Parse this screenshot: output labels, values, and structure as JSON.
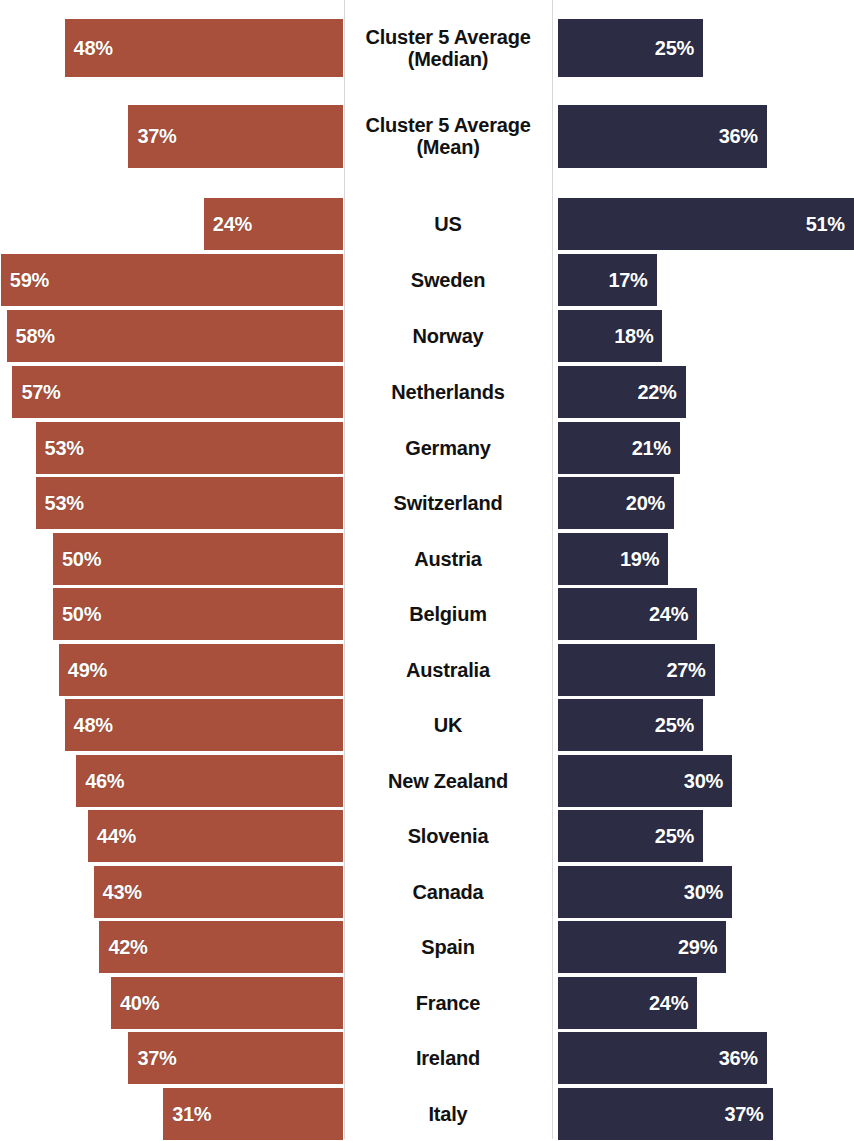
{
  "chart_data": {
    "type": "bar",
    "orientation": "horizontal-diverging",
    "title": "",
    "subtitle": "",
    "xlabel": "",
    "ylabel": "",
    "grid": false,
    "legend_position": "none",
    "axis_unit": "%",
    "xlim": [
      0,
      60
    ],
    "categories": [
      "Cluster 5 Average\n(Median)",
      "Cluster 5 Average\n(Mean)",
      "US",
      "Sweden",
      "Norway",
      "Netherlands",
      "Germany",
      "Switzerland",
      "Austria",
      "Belgium",
      "Australia",
      "UK",
      "New Zealand",
      "Slovenia",
      "Canada",
      "Spain",
      "France",
      "Ireland",
      "Italy"
    ],
    "series": [
      {
        "name": "left",
        "color": "#a8503c",
        "direction": "left",
        "values": [
          48,
          37,
          24,
          59,
          58,
          57,
          53,
          53,
          50,
          50,
          49,
          48,
          46,
          44,
          43,
          42,
          40,
          37,
          31
        ],
        "labels": [
          "48%",
          "37%",
          "24%",
          "59%",
          "58%",
          "57%",
          "53%",
          "53%",
          "50%",
          "50%",
          "49%",
          "48%",
          "46%",
          "44%",
          "43%",
          "42%",
          "40%",
          "37%",
          "31%"
        ]
      },
      {
        "name": "right",
        "color": "#2c2c45",
        "direction": "right",
        "values": [
          25,
          36,
          51,
          17,
          18,
          22,
          21,
          20,
          19,
          24,
          27,
          25,
          30,
          25,
          30,
          29,
          24,
          36,
          37
        ],
        "labels": [
          "25%",
          "36%",
          "51%",
          "17%",
          "18%",
          "22%",
          "21%",
          "20%",
          "19%",
          "24%",
          "27%",
          "25%",
          "30%",
          "25%",
          "30%",
          "29%",
          "24%",
          "36%",
          "37%"
        ]
      }
    ]
  },
  "rows": [
    {
      "label": "Cluster 5 Average\n(Median)",
      "left": 48,
      "left_label": "48%",
      "right": 25,
      "right_label": "25%",
      "top": 8,
      "height": 80,
      "bar_height": 58
    },
    {
      "label": "Cluster 5 Average\n(Mean)",
      "left": 37,
      "left_label": "37%",
      "right": 36,
      "right_label": "36%",
      "top": 96,
      "height": 80,
      "bar_height": 63
    },
    {
      "label": "US",
      "left": 24,
      "left_label": "24%",
      "right": 51,
      "right_label": "51%",
      "top": 196,
      "height": 55,
      "bar_height": 52
    },
    {
      "label": "Sweden",
      "left": 59,
      "left_label": "59%",
      "right": 17,
      "right_label": "17%",
      "top": 252,
      "height": 55,
      "bar_height": 52
    },
    {
      "label": "Norway",
      "left": 58,
      "left_label": "58%",
      "right": 18,
      "right_label": "18%",
      "top": 308,
      "height": 55,
      "bar_height": 52
    },
    {
      "label": "Netherlands",
      "left": 57,
      "left_label": "57%",
      "right": 22,
      "right_label": "22%",
      "top": 364,
      "height": 55,
      "bar_height": 52
    },
    {
      "label": "Germany",
      "left": 53,
      "left_label": "53%",
      "right": 21,
      "right_label": "21%",
      "top": 420,
      "height": 55,
      "bar_height": 52
    },
    {
      "label": "Switzerland",
      "left": 53,
      "left_label": "53%",
      "right": 20,
      "right_label": "20%",
      "top": 475,
      "height": 55,
      "bar_height": 52
    },
    {
      "label": "Austria",
      "left": 50,
      "left_label": "50%",
      "right": 19,
      "right_label": "19%",
      "top": 531,
      "height": 55,
      "bar_height": 52
    },
    {
      "label": "Belgium",
      "left": 50,
      "left_label": "50%",
      "right": 24,
      "right_label": "24%",
      "top": 586,
      "height": 55,
      "bar_height": 52
    },
    {
      "label": "Australia",
      "left": 49,
      "left_label": "49%",
      "right": 27,
      "right_label": "27%",
      "top": 642,
      "height": 55,
      "bar_height": 52
    },
    {
      "label": "UK",
      "left": 48,
      "left_label": "48%",
      "right": 25,
      "right_label": "25%",
      "top": 697,
      "height": 55,
      "bar_height": 52
    },
    {
      "label": "New Zealand",
      "left": 46,
      "left_label": "46%",
      "right": 30,
      "right_label": "30%",
      "top": 753,
      "height": 55,
      "bar_height": 52
    },
    {
      "label": "Slovenia",
      "left": 44,
      "left_label": "44%",
      "right": 25,
      "right_label": "25%",
      "top": 808,
      "height": 55,
      "bar_height": 52
    },
    {
      "label": "Canada",
      "left": 43,
      "left_label": "43%",
      "right": 30,
      "right_label": "30%",
      "top": 864,
      "height": 55,
      "bar_height": 52
    },
    {
      "label": "Spain",
      "left": 42,
      "left_label": "42%",
      "right": 29,
      "right_label": "29%",
      "top": 919,
      "height": 55,
      "bar_height": 52
    },
    {
      "label": "France",
      "left": 40,
      "left_label": "40%",
      "right": 24,
      "right_label": "24%",
      "top": 975,
      "height": 55,
      "bar_height": 52
    },
    {
      "label": "Ireland",
      "left": 37,
      "left_label": "37%",
      "right": 36,
      "right_label": "36%",
      "top": 1030,
      "height": 55,
      "bar_height": 52
    },
    {
      "label": "Italy",
      "left": 31,
      "left_label": "31%",
      "right": 37,
      "right_label": "37%",
      "top": 1086,
      "height": 55,
      "bar_height": 52
    }
  ],
  "scale": {
    "px_per_percent": 5.8
  },
  "colors": {
    "left_bar": "#a8503c",
    "right_bar": "#2c2c45",
    "label_text": "#121212",
    "value_text": "#ffffff",
    "background": "#ffffff",
    "divider": "#d8d8dc"
  }
}
